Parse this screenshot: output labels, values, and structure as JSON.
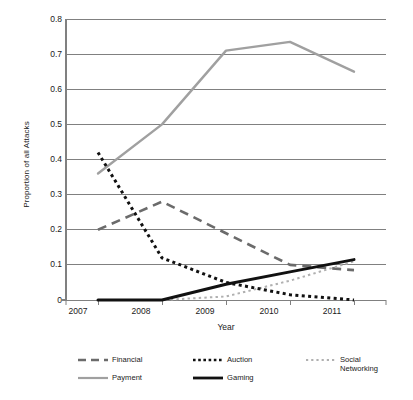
{
  "chart_data": {
    "type": "line",
    "title": "",
    "xlabel": "Year",
    "ylabel": "Proportion of all Attacks",
    "x": [
      "2007",
      "2008",
      "2009",
      "2010",
      "2011"
    ],
    "categories": [
      "2007",
      "2008",
      "2009",
      "2010",
      "2011"
    ],
    "xlim": [
      2006.5,
      2011.5
    ],
    "ylim": [
      0,
      0.8
    ],
    "yticks": [
      "0",
      "0.1",
      "0.2",
      "0.3",
      "0.4",
      "0.5",
      "0.6",
      "0.7",
      "0.8"
    ],
    "ytick_values": [
      0,
      0.1,
      0.2,
      0.3,
      0.4,
      0.5,
      0.6,
      0.7,
      0.8
    ],
    "grid": "horizontal",
    "legend_position": "bottom",
    "series": [
      {
        "name": "Financial",
        "style": "long-dash",
        "color": "#6b6b6b",
        "values": [
          0.2,
          0.28,
          0.19,
          0.1,
          0.085
        ]
      },
      {
        "name": "Auction",
        "style": "dotted",
        "color": "#111111",
        "values": [
          0.42,
          0.12,
          0.05,
          0.015,
          0.0
        ]
      },
      {
        "name": "Social Networking",
        "style": "fine-dotted",
        "color": "#b0b0b0",
        "values": [
          0.0,
          0.0,
          0.01,
          0.055,
          0.11
        ]
      },
      {
        "name": "Payment",
        "style": "solid",
        "color": "#a0a0a0",
        "values": [
          0.36,
          0.5,
          0.71,
          0.735,
          0.65
        ]
      },
      {
        "name": "Gaming",
        "style": "solid-bold",
        "color": "#111111",
        "values": [
          0.0,
          0.0,
          0.045,
          0.08,
          0.115
        ]
      }
    ]
  },
  "axes": {
    "ylabel": "Proportion of all Attacks",
    "xlabel": "Year",
    "ytick_labels": [
      "0.8",
      "0.7",
      "0.6",
      "0.5",
      "0.4",
      "0.3",
      "0.2",
      "0.1",
      "0"
    ],
    "xtick_labels": [
      "2007",
      "2008",
      "2009",
      "2010",
      "2011"
    ]
  },
  "legend": {
    "items": [
      {
        "label": "Financial",
        "swatch": "long-dash-swatch"
      },
      {
        "label": "Auction",
        "swatch": "dotted-swatch"
      },
      {
        "label": "Social\nNetworking",
        "swatch": "fine-dotted-swatch"
      },
      {
        "label": "Payment",
        "swatch": "solid-gray-swatch"
      },
      {
        "label": "Gaming",
        "swatch": "solid-black-swatch"
      }
    ]
  }
}
